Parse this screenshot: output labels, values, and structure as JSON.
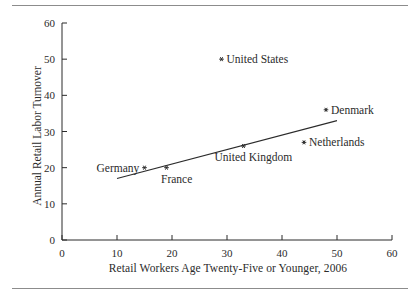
{
  "figure": {
    "has_top_rule": true,
    "has_bottom_rule": true,
    "background": "#ffffff",
    "ink_color": "#2b2b2b"
  },
  "chart_data": {
    "type": "scatter",
    "title": "",
    "xlabel": "Retail Workers Age Twenty-Five or Younger, 2006",
    "ylabel": "Annual Retail Labor Turnover",
    "xlim": [
      0,
      60
    ],
    "ylim": [
      0,
      60
    ],
    "xticks": [
      0,
      10,
      20,
      30,
      40,
      50,
      60
    ],
    "yticks": [
      0,
      10,
      20,
      30,
      40,
      50,
      60
    ],
    "xtick_labels": [
      "0",
      "10",
      "20",
      "30",
      "40",
      "50",
      "60"
    ],
    "ytick_labels": [
      "0",
      "10",
      "20",
      "30",
      "40",
      "50",
      "60"
    ],
    "grid": false,
    "legend": false,
    "points": [
      {
        "label": "United States",
        "x": 29,
        "y": 50,
        "label_side": "right"
      },
      {
        "label": "Denmark",
        "x": 48,
        "y": 36,
        "label_side": "right"
      },
      {
        "label": "Netherlands",
        "x": 44,
        "y": 27,
        "label_side": "right"
      },
      {
        "label": "United Kingdom",
        "x": 33,
        "y": 26,
        "label_side": "below"
      },
      {
        "label": "France",
        "x": 19,
        "y": 20,
        "label_side": "below"
      },
      {
        "label": "Germany",
        "x": 15,
        "y": 20,
        "label_side": "left"
      }
    ],
    "trendline": {
      "x0": 10,
      "y0": 17,
      "x1": 50,
      "y1": 33
    }
  }
}
